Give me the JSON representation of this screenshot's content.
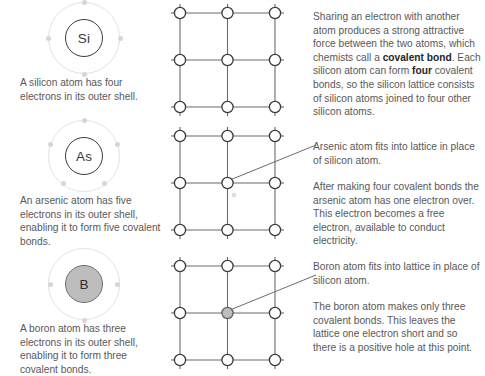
{
  "rows": [
    {
      "id": "silicon",
      "atom": {
        "symbol": "Si",
        "electron_count": 4,
        "filled": false,
        "caption": "A silicon atom has four electrons in its outer shell."
      },
      "lattice": {
        "label": "silicon-lattice",
        "center_atom_filled": false,
        "has_free_electron": false,
        "has_leader_line": false
      },
      "paragraphs": [
        {
          "id": "si-para",
          "segments": [
            {
              "text": "Sharing an electron with another atom produces a strong attractive force between the two atoms, which chemists call a ",
              "bold": false
            },
            {
              "text": "covalent bond",
              "bold": true
            },
            {
              "text": ". Each silicon atom can form ",
              "bold": false
            },
            {
              "text": "four",
              "bold": true
            },
            {
              "text": " covalent bonds, so the silicon lattice consists of silicon atoms joined to four other silicon atoms.",
              "bold": false
            }
          ]
        }
      ]
    },
    {
      "id": "arsenic",
      "atom": {
        "symbol": "As",
        "electron_count": 5,
        "filled": false,
        "caption": "An arsenic atom has five electrons in its outer shell, enabling it to form five covalent bonds."
      },
      "lattice": {
        "label": "arsenic-lattice",
        "center_atom_filled": false,
        "has_free_electron": true,
        "has_leader_line": true
      },
      "paragraphs": [
        {
          "id": "as-para-1",
          "segments": [
            {
              "text": "Arsenic atom fits into lattice in place of silicon atom.",
              "bold": false
            }
          ]
        },
        {
          "id": "as-para-2",
          "segments": [
            {
              "text": "After making four covalent bonds the arsenic atom has one electron over. This electron becomes a free electron, available to conduct electricity.",
              "bold": false
            }
          ]
        }
      ]
    },
    {
      "id": "boron",
      "atom": {
        "symbol": "B",
        "electron_count": 3,
        "filled": true,
        "caption": "A boron atom has three electrons in its outer shell, enabling it to form three covalent bonds."
      },
      "lattice": {
        "label": "boron-lattice",
        "center_atom_filled": true,
        "has_free_electron": false,
        "has_leader_line": true
      },
      "paragraphs": [
        {
          "id": "b-para-1",
          "segments": [
            {
              "text": "Boron atom fits into lattice in place of silicon atom.",
              "bold": false
            }
          ]
        },
        {
          "id": "b-para-2",
          "segments": [
            {
              "text": "The boron atom makes only three covalent bonds. This leaves the lattice one electron short and so there is a positive hole at this point.",
              "bold": false
            }
          ]
        }
      ]
    }
  ],
  "colors": {
    "background": "#ffffff",
    "body_text": "#58585a",
    "bold_text": "#252527",
    "lattice_line": "#6b6b6d",
    "atom_outline": "#3a3a3c",
    "atom_fill_white": "#ffffff",
    "atom_fill_gray": "#bdbdbd",
    "shell_ring": "#e2e2e4",
    "electron_dot": "#d6d6d8"
  }
}
